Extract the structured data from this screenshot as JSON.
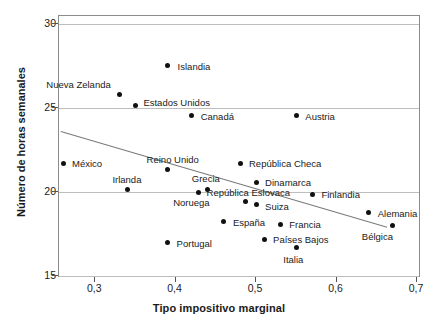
{
  "chart_data": {
    "type": "scatter",
    "title": "",
    "xlabel": "Tipo impositivo marginal",
    "ylabel": "Número de horas semanales",
    "xlim": [
      0.255,
      0.705
    ],
    "ylim": [
      14.85,
      30.45
    ],
    "xticks": [
      "0,3",
      "0,4",
      "0,5",
      "0,6",
      "0,7"
    ],
    "xtick_values": [
      0.3,
      0.4,
      0.5,
      0.6,
      0.7
    ],
    "yticks": [
      "15",
      "20",
      "25",
      "30"
    ],
    "ytick_values": [
      15,
      20,
      25,
      30
    ],
    "grid": "horizontal",
    "legend": "none",
    "points": [
      {
        "label": "Islandia",
        "x": 0.39,
        "y": 27.5,
        "lx": 10,
        "ly": -4
      },
      {
        "label": "Nueva Zelanda",
        "x": 0.33,
        "y": 25.8,
        "lx": -73,
        "ly": -14
      },
      {
        "label": "Estados Unidos",
        "x": 0.35,
        "y": 25.1,
        "lx": 8,
        "ly": -8
      },
      {
        "label": "Canadá",
        "x": 0.42,
        "y": 24.5,
        "lx": 9,
        "ly": -4
      },
      {
        "label": "Austria",
        "x": 0.55,
        "y": 24.5,
        "lx": 9,
        "ly": -4
      },
      {
        "label": "México",
        "x": 0.26,
        "y": 21.7,
        "lx": 9,
        "ly": -4
      },
      {
        "label": "Reino Unido",
        "x": 0.39,
        "y": 21.3,
        "lx": -21,
        "ly": -15
      },
      {
        "label": "República Checa",
        "x": 0.48,
        "y": 21.7,
        "lx": 9,
        "ly": -4
      },
      {
        "label": "Dinamarca",
        "x": 0.5,
        "y": 20.55,
        "lx": 9,
        "ly": -4
      },
      {
        "label": "Irlanda",
        "x": 0.34,
        "y": 20.1,
        "lx": -15,
        "ly": -15
      },
      {
        "label": "Grecia",
        "x": 0.44,
        "y": 20.15,
        "lx": -16,
        "ly": -15
      },
      {
        "label": "Noruega",
        "x": 0.428,
        "y": 19.95,
        "lx": -25,
        "ly": 6
      },
      {
        "label": "República Eslovaca",
        "x": 0.487,
        "y": 19.4,
        "lx": -39,
        "ly": -14
      },
      {
        "label": "Finlandia",
        "x": 0.57,
        "y": 19.85,
        "lx": 9,
        "ly": -4
      },
      {
        "label": "Suiza",
        "x": 0.5,
        "y": 19.2,
        "lx": 9,
        "ly": -3
      },
      {
        "label": "Alemania",
        "x": 0.64,
        "y": 18.75,
        "lx": 9,
        "ly": -4
      },
      {
        "label": "España",
        "x": 0.46,
        "y": 18.2,
        "lx": 9,
        "ly": -4
      },
      {
        "label": "Francia",
        "x": 0.53,
        "y": 18.05,
        "lx": 9,
        "ly": -4
      },
      {
        "label": "Bélgica",
        "x": 0.67,
        "y": 18.0,
        "lx": -31,
        "ly": 7
      },
      {
        "label": "Países Bajos",
        "x": 0.51,
        "y": 17.15,
        "lx": 9,
        "ly": -4
      },
      {
        "label": "Portugal",
        "x": 0.39,
        "y": 16.95,
        "lx": 9,
        "ly": -4
      },
      {
        "label": "Italia",
        "x": 0.55,
        "y": 16.65,
        "lx": -13,
        "ly": 7
      }
    ],
    "trendline": {
      "x0": 0.258,
      "y0": 23.6,
      "x1": 0.663,
      "y1": 17.9
    }
  }
}
